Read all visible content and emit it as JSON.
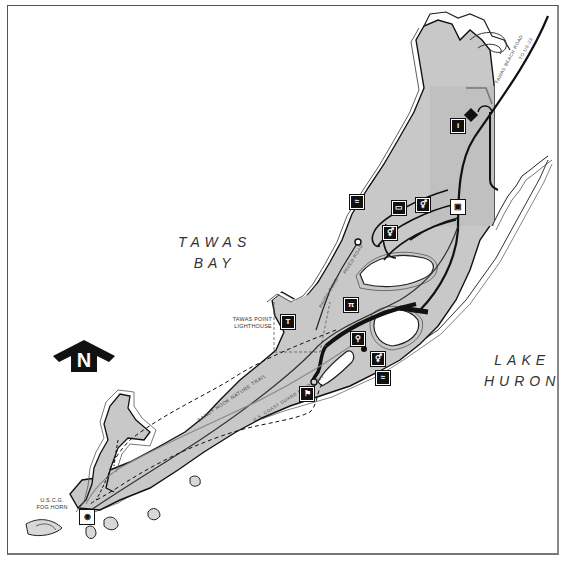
{
  "map": {
    "water_bodies": [
      {
        "id": "tawas-bay",
        "line1": "TAWAS",
        "line2": "BAY"
      },
      {
        "id": "lake-huron",
        "line1": "LAKE",
        "line2": "HURON"
      }
    ],
    "landmarks": {
      "lighthouse": {
        "line1": "TAWAS POINT",
        "line2": "LIGHTHOUSE"
      },
      "fog_horn": {
        "line1": "U.S.C.G.",
        "line2": "FOG HORN"
      }
    },
    "roads": {
      "tawas_beach_road": "TAWAS BEACH ROAD",
      "to_us23": "TO US-23",
      "paved_road": "PAVED ROAD",
      "coast_guard_road": "U.S. COAST GUARD ROAD ONLY",
      "nature_trail": "SANDY HOOK NATURE TRAIL"
    },
    "north_arrow": {
      "letter": "N"
    },
    "icons": [
      {
        "type": "contact-station-icon",
        "glyph": "i"
      },
      {
        "type": "swimming-icon",
        "glyph": "≈"
      },
      {
        "type": "camper-icon",
        "glyph": "▭"
      },
      {
        "type": "restroom-icon",
        "glyph": "⚥"
      },
      {
        "type": "restroom-icon",
        "glyph": "⚥"
      },
      {
        "type": "store-icon",
        "glyph": "▣"
      },
      {
        "type": "lighthouse-icon",
        "glyph": "T"
      },
      {
        "type": "picnic-icon",
        "glyph": "π"
      },
      {
        "type": "playground-icon",
        "glyph": "⚲"
      },
      {
        "type": "restroom-icon",
        "glyph": "⚥"
      },
      {
        "type": "swimming-icon",
        "glyph": "≈"
      },
      {
        "type": "hiking-icon",
        "glyph": "⚑"
      },
      {
        "type": "fog-horn-icon",
        "glyph": "◉"
      }
    ],
    "colors": {
      "park_fill": "#c4c4c4",
      "land_fill": "#d0d0d0",
      "shoreline": "#222222",
      "road": "#111111",
      "water": "#ffffff"
    }
  }
}
